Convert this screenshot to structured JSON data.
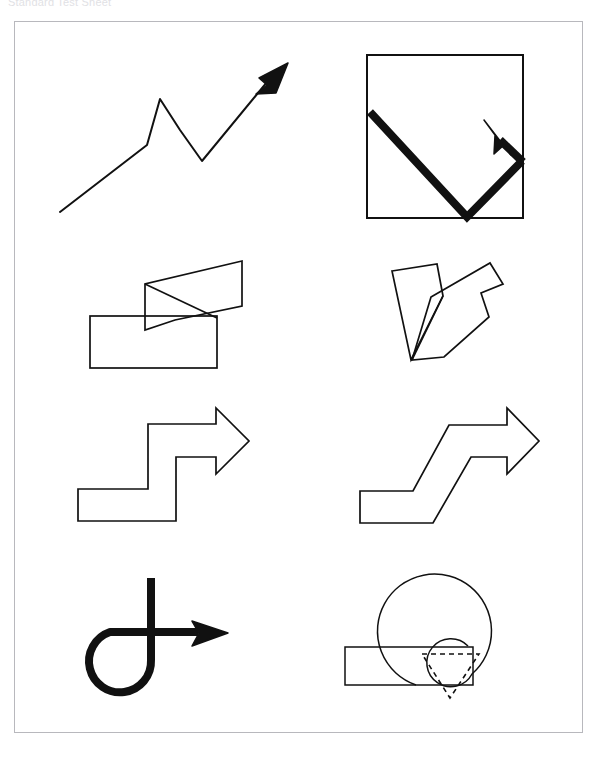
{
  "header": {
    "clipped_text": "Standard Test Sheet"
  },
  "plate": {
    "name": "arrow-figures-plate",
    "background_color": "#ffffff",
    "border_color": "#b8b8bd",
    "stroke_color": "#111111",
    "frame": {
      "x": 14,
      "y": 21,
      "width": 569,
      "height": 712
    }
  },
  "figures": [
    {
      "id": "fig-1",
      "name": "zigzag-line-arrow",
      "description": "Thin polyline rising to the right with a single downward zigzag notch, ending in a solid filled arrowhead pointing up-right",
      "style": {
        "stroke_width": 2,
        "fill": "none",
        "dashed": false
      },
      "points": [
        [
          60,
          212
        ],
        [
          147,
          145
        ],
        [
          160,
          99
        ],
        [
          180,
          130
        ],
        [
          202,
          161
        ],
        [
          276,
          72
        ]
      ],
      "arrowhead": {
        "type": "solid-filled",
        "tip": [
          288,
          63
        ],
        "direction": "up-right"
      }
    },
    {
      "id": "fig-2",
      "name": "square-with-thick-v-arrow",
      "description": "Square outline containing a thick V shaped arrow going down-right then up-right and an arrowhead pointing up-left",
      "style": {
        "stroke_width": 2,
        "fill": "none",
        "dashed": false
      },
      "square": {
        "x": 367,
        "y": 55,
        "width": 156,
        "height": 163
      },
      "arrow_stroke_width": 8,
      "points": [
        [
          370,
          112
        ],
        [
          467,
          216
        ],
        [
          522,
          162
        ]
      ],
      "return_segment": [
        [
          522,
          162
        ],
        [
          497,
          140
        ]
      ],
      "arrowhead": {
        "type": "solid-filled",
        "tip": [
          485,
          122
        ],
        "direction": "up-left"
      }
    },
    {
      "id": "fig-3",
      "name": "rectangle-with-bent-quadrilateral",
      "description": "Horizontal rectangle with an overlapping slanted quadrilateral rising to the upper right, outlines only",
      "style": {
        "stroke_width": 1.6,
        "fill": "none",
        "dashed": false
      },
      "rectangle": {
        "x": 90,
        "y": 316,
        "width": 127,
        "height": 52
      },
      "polygon": [
        [
          145,
          330
        ],
        [
          145,
          284
        ],
        [
          242,
          261
        ],
        [
          242,
          306
        ],
        [
          175,
          320
        ]
      ]
    },
    {
      "id": "fig-4",
      "name": "v-shaped-overlapping-polygon",
      "description": "Two overlapping slanted quadrilaterals forming a V or checkmark outline",
      "style": {
        "stroke_width": 1.6,
        "fill": "none",
        "dashed": false
      },
      "polygon_left": [
        [
          392,
          270
        ],
        [
          437,
          264
        ],
        [
          442,
          293
        ],
        [
          411,
          360
        ]
      ],
      "polygon_right": [
        [
          432,
          296
        ],
        [
          489,
          263
        ],
        [
          502,
          283
        ],
        [
          480,
          292
        ],
        [
          487,
          316
        ],
        [
          443,
          357
        ],
        [
          412,
          360
        ]
      ]
    },
    {
      "id": "fig-5",
      "name": "stepped-block-arrow-right",
      "description": "Outline block arrow with square staircase steps rising to the right, chevron head pointing right",
      "style": {
        "stroke_width": 1.6,
        "fill": "none",
        "dashed": false
      },
      "outline": [
        [
          78,
          520
        ],
        [
          78,
          488
        ],
        [
          148,
          488
        ],
        [
          148,
          424
        ],
        [
          215,
          424
        ],
        [
          215,
          408
        ],
        [
          247,
          441
        ],
        [
          215,
          473
        ],
        [
          215,
          457
        ],
        [
          175,
          457
        ],
        [
          175,
          520
        ]
      ]
    },
    {
      "id": "fig-6",
      "name": "sloped-block-arrow-right",
      "description": "Outline block arrow with diagonal sloped risers instead of square steps, chevron head pointing right",
      "style": {
        "stroke_width": 1.6,
        "fill": "none",
        "dashed": false
      },
      "outline": [
        [
          360,
          522
        ],
        [
          360,
          490
        ],
        [
          412,
          490
        ],
        [
          448,
          425
        ],
        [
          506,
          425
        ],
        [
          506,
          408
        ],
        [
          537,
          441
        ],
        [
          506,
          473
        ],
        [
          506,
          457
        ],
        [
          470,
          457
        ],
        [
          432,
          522
        ]
      ]
    },
    {
      "id": "fig-7",
      "name": "loop-and-straight-arrow",
      "description": "Thick loop curl at lower left joined to a vertical stroke and a horizontal arrow pointing right",
      "style": {
        "stroke_width": 8,
        "fill": "none",
        "dashed": false
      },
      "vertical_stroke": [
        [
          151,
          578
        ],
        [
          151,
          677
        ]
      ],
      "loop_circle": {
        "cx": 128,
        "cy": 653,
        "r": 31
      },
      "horizontal_stroke": [
        [
          104,
          633
        ],
        [
          198,
          633
        ]
      ],
      "arrowhead": {
        "type": "solid-filled",
        "tip": [
          225,
          633
        ],
        "direction": "right"
      }
    },
    {
      "id": "fig-8",
      "name": "spiral-loop-with-dashed-arrowhead",
      "description": "Thin spiral / nested loop outline overlapping a horizontal bar, with a dashed downward pointing triangular arrowhead",
      "style": {
        "stroke_width": 1.4,
        "fill": "none",
        "dashed": false
      },
      "outer_arc": {
        "cx": 472,
        "cy": 617,
        "r": 57
      },
      "inner_arc": {
        "cx": 478,
        "cy": 635,
        "r": 24
      },
      "bar": {
        "x": 345,
        "y": 647,
        "width": 128,
        "height": 38
      },
      "dashed_arrowhead": {
        "dashed": true,
        "dash_pattern": "5 4",
        "points": [
          [
            422,
            654
          ],
          [
            478,
            654
          ],
          [
            450,
            697
          ]
        ],
        "direction": "down"
      }
    }
  ]
}
